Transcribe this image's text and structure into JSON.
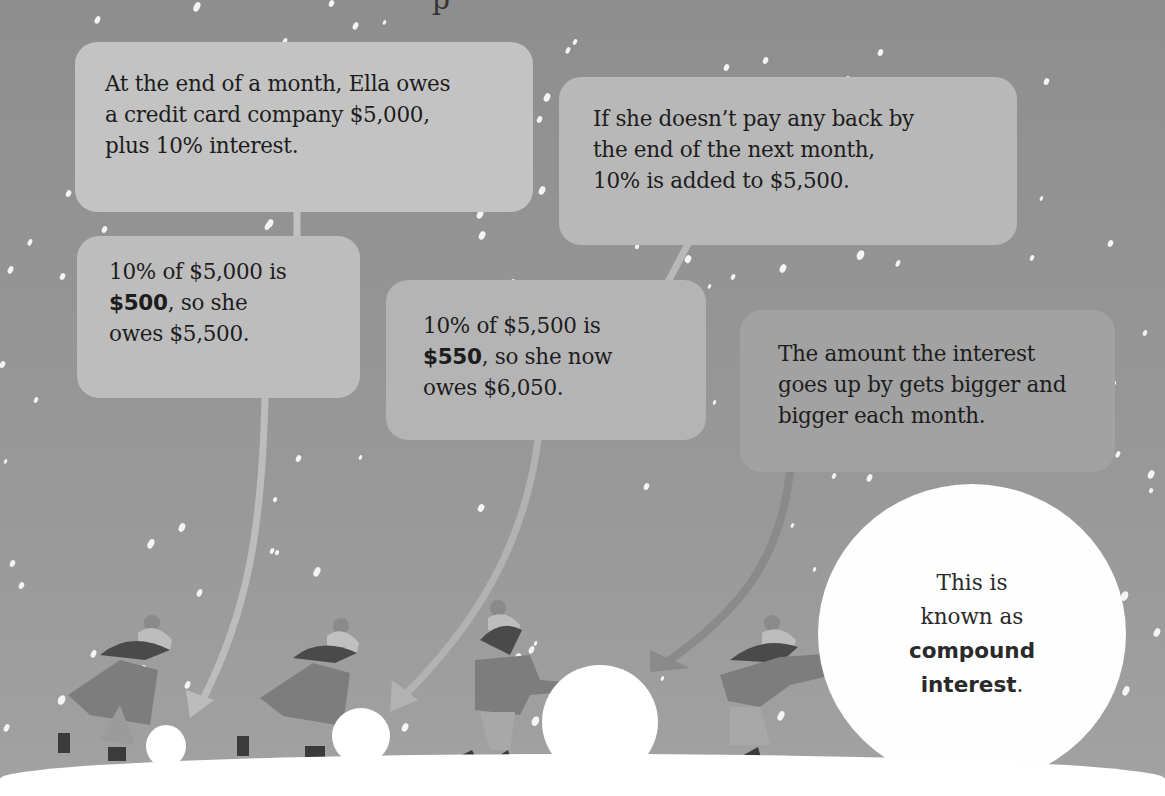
{
  "page": {
    "top_stub_char": "p",
    "background_color": "#8f8f8f"
  },
  "callouts": [
    {
      "id": "start",
      "lines": [
        "At the end of a month, Ella owes",
        "a credit card company $5,000,",
        "plus 10% interest."
      ]
    },
    {
      "id": "next-month",
      "lines": [
        "If she doesn’t pay any back by",
        "the end of the next month,",
        "10% is added to $5,500."
      ]
    },
    {
      "id": "month-1-calc",
      "bold": "$500",
      "lines": [
        "10% of $5,000 is",
        ", so she",
        "owes $5,500."
      ]
    },
    {
      "id": "month-2-calc",
      "bold": "$550",
      "lines": [
        "10% of $5,500 is",
        ", so she now",
        "owes $6,050."
      ]
    },
    {
      "id": "growth",
      "lines": [
        "The amount the interest",
        "goes up by gets bigger and",
        "bigger each month."
      ]
    }
  ],
  "conclusion": {
    "line1": "This is",
    "line2": "known as",
    "bold1": "compound",
    "bold2": "interest",
    "tail": "."
  },
  "figures": [
    {
      "name": "girl-1",
      "snowball": "small"
    },
    {
      "name": "girl-2",
      "snowball": "small-medium"
    },
    {
      "name": "girl-3",
      "snowball": "medium"
    },
    {
      "name": "girl-4",
      "snowball": "large"
    }
  ]
}
